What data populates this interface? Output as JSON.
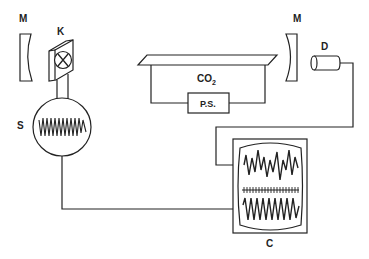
{
  "diagram": {
    "type": "laser-experiment-schematic",
    "labels": {
      "mirror_left": "M",
      "mirror_right": "M",
      "chopper": "K",
      "signal_source": "S",
      "laser_medium": "CO",
      "laser_medium_subscript": "2",
      "power_supply": "P.S.",
      "detector": "D",
      "oscilloscope": "C"
    },
    "components": [
      {
        "id": "M1",
        "name": "Mirror (left)"
      },
      {
        "id": "K",
        "name": "Chopper / modulator"
      },
      {
        "id": "S",
        "name": "Signal source (oscillator)"
      },
      {
        "id": "CO2",
        "name": "CO2 laser tube"
      },
      {
        "id": "PS",
        "name": "Power supply"
      },
      {
        "id": "M2",
        "name": "Mirror (right)"
      },
      {
        "id": "D",
        "name": "Detector"
      },
      {
        "id": "C",
        "name": "Oscilloscope"
      }
    ],
    "connections": [
      {
        "from": "K",
        "to": "S"
      },
      {
        "from": "S",
        "to": "C"
      },
      {
        "from": "D",
        "to": "C"
      },
      {
        "from": "CO2",
        "to": "PS"
      }
    ],
    "colors": {
      "stroke": "#222222",
      "background": "#ffffff"
    }
  }
}
